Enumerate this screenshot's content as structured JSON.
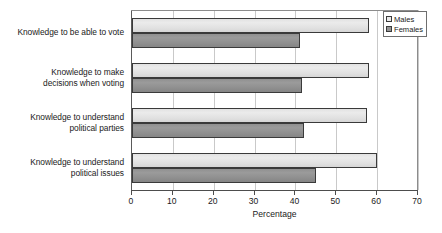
{
  "chart_data": {
    "type": "bar",
    "orientation": "horizontal",
    "title": "",
    "xlabel": "Percentage",
    "ylabel": "",
    "xlim": [
      0,
      70
    ],
    "xticks": [
      0,
      10,
      20,
      30,
      40,
      50,
      60,
      70
    ],
    "xtick_labels": [
      "0",
      "10",
      "20",
      "30",
      "40",
      "50",
      "60",
      "70"
    ],
    "grid": true,
    "grid_axis": "x",
    "legend_position": "top-right",
    "categories": [
      "Knowledge to be able to vote",
      "Knowledge to make decisions when voting",
      "Knowledge to understand political parties",
      "Knowledge to understand political issues"
    ],
    "category_lines": [
      [
        "Knowledge to be able to vote"
      ],
      [
        "Knowledge to make",
        "decisions when voting"
      ],
      [
        "Knowledge to understand",
        "political parties"
      ],
      [
        "Knowledge to understand",
        "political issues"
      ]
    ],
    "series": [
      {
        "name": "Males",
        "values": [
          58,
          58,
          57.5,
          60
        ],
        "color": "#e8e8e8"
      },
      {
        "name": "Females",
        "values": [
          41,
          41.5,
          42,
          45
        ],
        "color": "#949494"
      }
    ]
  },
  "legend": {
    "entries": [
      {
        "label": "Males"
      },
      {
        "label": "Females"
      }
    ]
  }
}
